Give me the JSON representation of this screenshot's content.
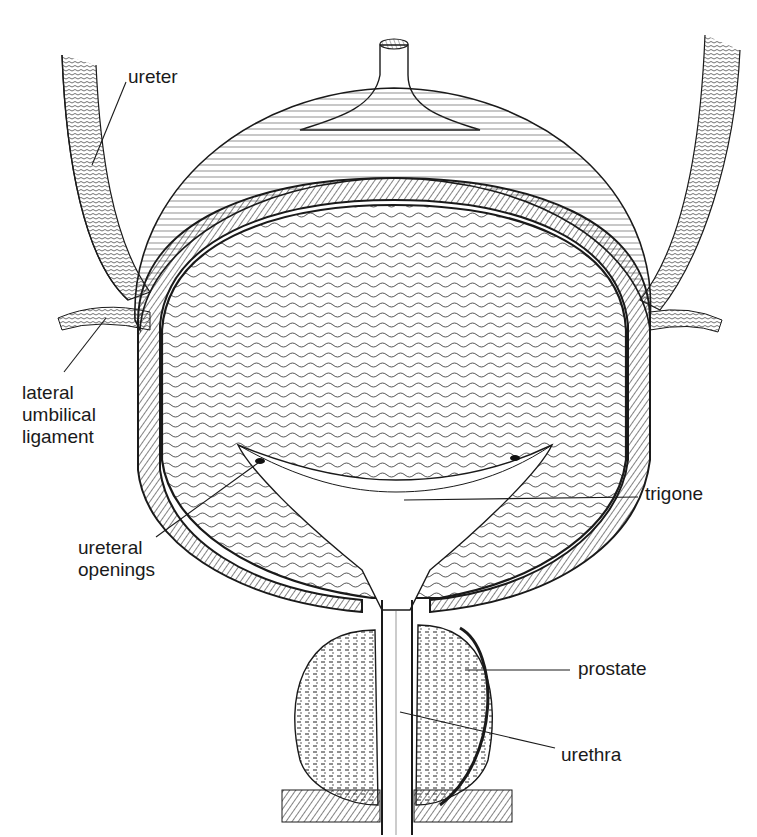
{
  "figure": {
    "style": "black ink line drawing on white",
    "colors": {
      "background": "#ffffff",
      "ink": "#1a1a1a",
      "label": "#1a1a1a"
    }
  },
  "labels": [
    {
      "id": "ureter",
      "text": "ureter",
      "x": 128,
      "y": 66,
      "leader": [
        [
          126,
          82
        ],
        [
          92,
          165
        ]
      ]
    },
    {
      "id": "lateral-umbilical-ligament",
      "lines": [
        "lateral",
        "umbilical",
        "ligament"
      ],
      "x": 22,
      "y": 382,
      "leader": [
        [
          64,
          372
        ],
        [
          106,
          318
        ]
      ]
    },
    {
      "id": "ureteral-openings",
      "lines": [
        "ureteral",
        "openings"
      ],
      "x": 78,
      "y": 537,
      "leader": [
        [
          156,
          537
        ],
        [
          258,
          463
        ]
      ]
    },
    {
      "id": "trigone",
      "text": "trigone",
      "x": 645,
      "y": 483,
      "leader": [
        [
          404,
          500
        ],
        [
          638,
          497
        ]
      ]
    },
    {
      "id": "prostate",
      "text": "prostate",
      "x": 578,
      "y": 658,
      "leader": [
        [
          465,
          670
        ],
        [
          570,
          670
        ]
      ]
    },
    {
      "id": "urethra",
      "text": "urethra",
      "x": 561,
      "y": 744,
      "leader": [
        [
          400,
          712
        ],
        [
          555,
          748
        ]
      ]
    }
  ]
}
